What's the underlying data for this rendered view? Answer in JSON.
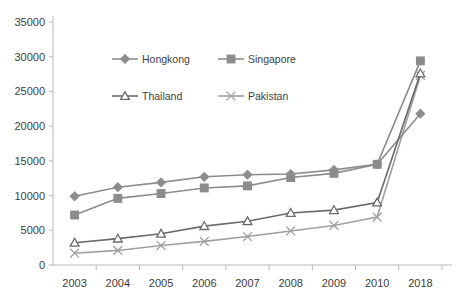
{
  "chart_data": {
    "type": "line",
    "title": "",
    "xlabel": "",
    "ylabel": "",
    "categories": [
      "2003",
      "2004",
      "2005",
      "2006",
      "2007",
      "2008",
      "2009",
      "2010",
      "2018"
    ],
    "ylim": [
      0,
      35000
    ],
    "ytick_labels": [
      "0",
      "5000",
      "10000",
      "15000",
      "20000",
      "25000",
      "30000",
      "35000"
    ],
    "ytick_values": [
      0,
      5000,
      10000,
      15000,
      20000,
      25000,
      30000,
      35000
    ],
    "grid": false,
    "legend_position": "upper-left-inside",
    "series": [
      {
        "name": "Hongkong",
        "marker": "diamond",
        "color": "#8c8c8c",
        "values": [
          9900,
          11200,
          11900,
          12700,
          13000,
          13100,
          13700,
          14500,
          21800
        ]
      },
      {
        "name": "Singapore",
        "marker": "square",
        "color": "#8c8c8c",
        "values": [
          7200,
          9600,
          10300,
          11100,
          11400,
          12600,
          13200,
          14500,
          29400
        ]
      },
      {
        "name": "Thailand",
        "marker": "triangle",
        "color": "#6b6b6b",
        "values": [
          3200,
          3800,
          4500,
          5600,
          6300,
          7500,
          7900,
          9000,
          27600
        ]
      },
      {
        "name": "Pakistan",
        "marker": "cross",
        "color": "#a0a0a0",
        "values": [
          1700,
          2100,
          2800,
          3400,
          4100,
          4900,
          5700,
          6900,
          27300
        ]
      }
    ]
  }
}
